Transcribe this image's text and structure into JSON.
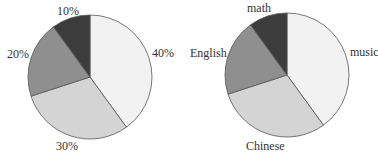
{
  "chart_data": [
    {
      "type": "pie",
      "title": "",
      "categories": [
        "music",
        "Chinese",
        "English",
        "math"
      ],
      "values": [
        40,
        30,
        20,
        10
      ],
      "labels": [
        "40%",
        "30%",
        "20%",
        "10%"
      ],
      "colors": [
        "#f2f2f2",
        "#d4d4d4",
        "#8f8f8f",
        "#3c3c3c"
      ]
    },
    {
      "type": "pie",
      "title": "",
      "categories": [
        "music",
        "Chinese",
        "English",
        "math"
      ],
      "values": [
        40,
        30,
        20,
        10
      ],
      "labels": [
        "music",
        "Chinese",
        "English",
        "math"
      ],
      "colors": [
        "#f2f2f2",
        "#d4d4d4",
        "#8f8f8f",
        "#3c3c3c"
      ]
    }
  ],
  "left": {
    "labels": [
      "40%",
      "30%",
      "20%",
      "10%"
    ]
  },
  "right": {
    "labels": [
      "music",
      "Chinese",
      "English",
      "math"
    ]
  }
}
